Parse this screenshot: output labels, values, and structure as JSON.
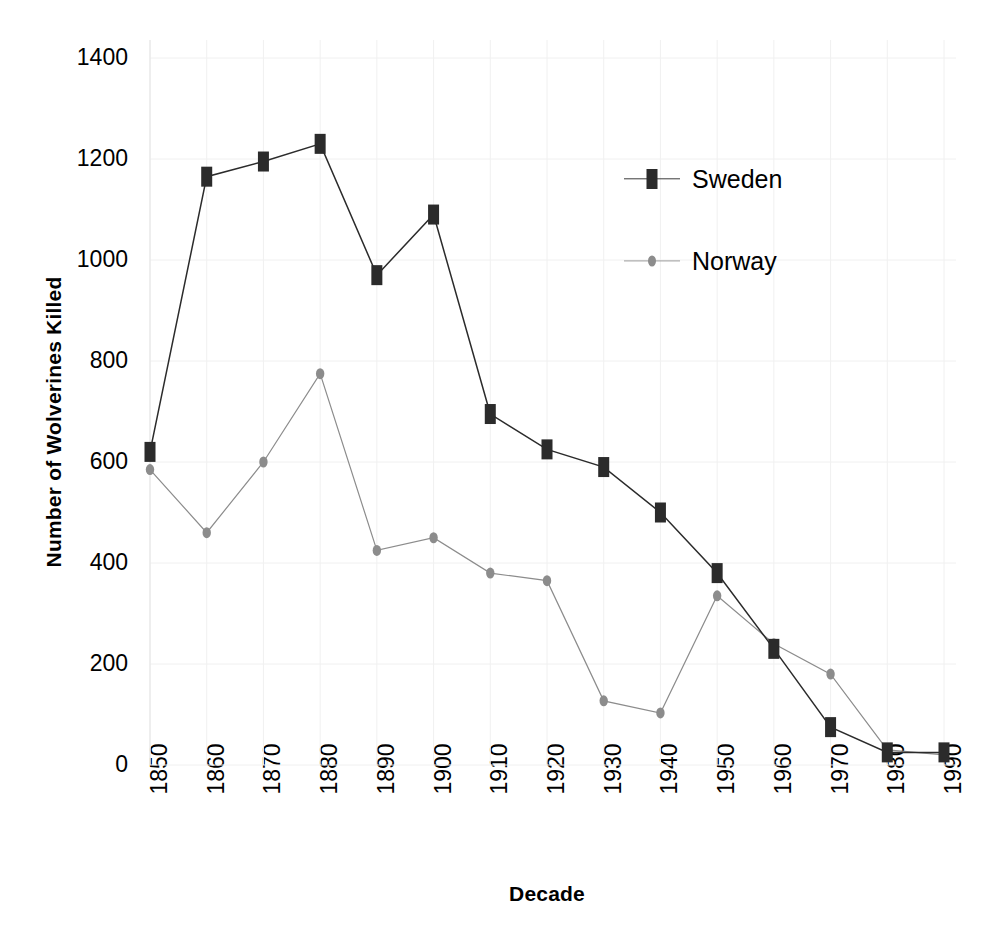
{
  "chart_data": {
    "type": "line",
    "title": "",
    "xlabel": "Decade",
    "ylabel": "Number of Wolverines Killed",
    "categories": [
      "1850",
      "1860",
      "1870",
      "1880",
      "1890",
      "1900",
      "1910",
      "1920",
      "1930",
      "1940",
      "1950",
      "1960",
      "1970",
      "1980",
      "1990"
    ],
    "series": [
      {
        "name": "Sweden",
        "color": "#2b2b2b",
        "marker": "square",
        "values": [
          620,
          1165,
          1195,
          1230,
          970,
          1090,
          695,
          625,
          590,
          500,
          380,
          230,
          75,
          25,
          25
        ]
      },
      {
        "name": "Norway",
        "color": "#8c8c8c",
        "marker": "circle",
        "values": [
          585,
          460,
          600,
          775,
          425,
          450,
          380,
          365,
          127,
          103,
          335,
          240,
          180,
          30,
          20
        ]
      }
    ],
    "ylim": [
      0,
      1400
    ],
    "yticks": [
      0,
      200,
      400,
      600,
      800,
      1000,
      1200,
      1400
    ],
    "ytick_labels": [
      "0",
      "200",
      "400",
      "600",
      "800",
      "1000",
      "1200",
      "1400"
    ],
    "grid": true,
    "grid_color": "#f0f0f0",
    "legend_position": "upper-right-inside",
    "axis_color": "#e8e8e8",
    "background": "#ffffff"
  }
}
